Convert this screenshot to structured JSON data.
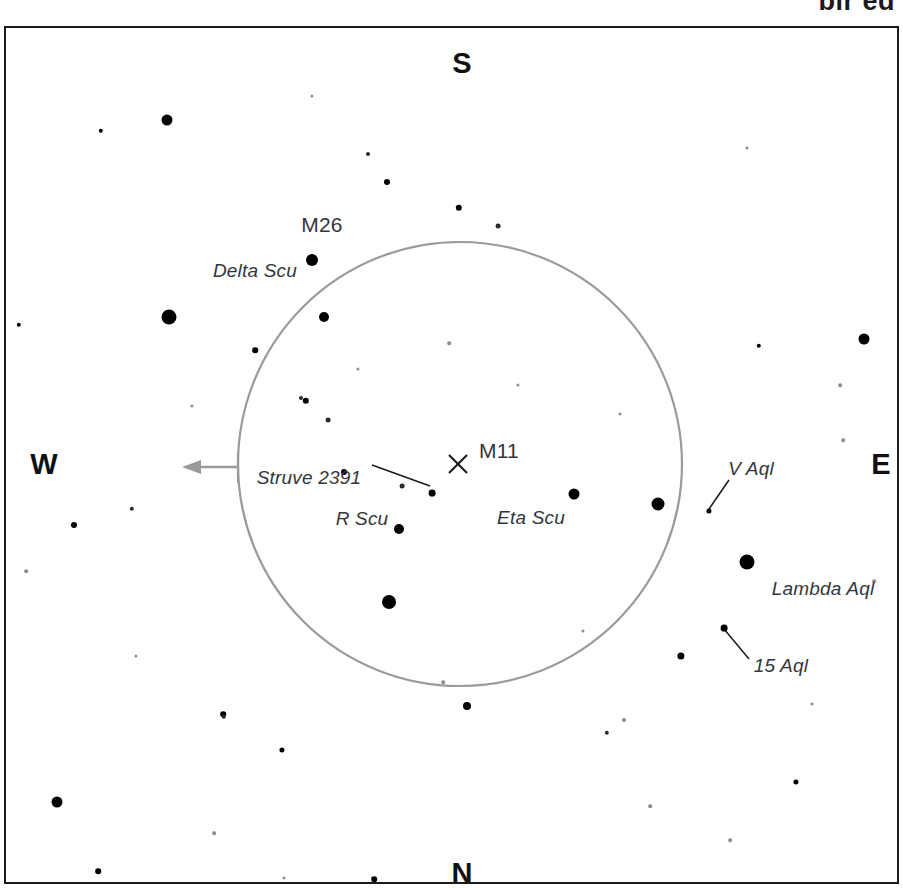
{
  "header": {
    "cropped_text": "bir ed"
  },
  "chart": {
    "frame": {
      "x": 4,
      "y": 26,
      "width": 895,
      "height": 858
    },
    "background_color": "#ffffff",
    "border_color": "#1b1b1b",
    "star_color": "#000000",
    "label_color": "#33363b",
    "fov_circle_color": "#9a9a9a",
    "arrow_color": "#9a9a9a"
  },
  "cardinals": [
    {
      "label": "S",
      "x": 456,
      "y": 35
    },
    {
      "label": "W",
      "x": 38,
      "y": 436
    },
    {
      "label": "E",
      "x": 875,
      "y": 436
    },
    {
      "label": "N",
      "x": 456,
      "y": 845
    }
  ],
  "fov_circle": {
    "cx": 454,
    "cy": 436,
    "r": 222,
    "stroke": "#9a9a9a",
    "stroke_width": 2.2
  },
  "west_arrow": {
    "from_x": 232,
    "from_y": 439,
    "to_x": 178,
    "to_y": 439,
    "tick_x": 232,
    "tick_top": 424,
    "tick_bottom": 455,
    "stroke": "#9a9a9a"
  },
  "center_marker": {
    "name": "M11",
    "x": 452,
    "y": 436,
    "size": 19,
    "stroke": "#1b1b1b"
  },
  "leader_lines": [
    {
      "name": "struve-2391-leader",
      "x1": 366,
      "y1": 437,
      "x2": 424,
      "y2": 458
    },
    {
      "name": "v-aql-leader",
      "x1": 723,
      "y1": 452,
      "x2": 703,
      "y2": 481
    },
    {
      "name": "15-aql-leader",
      "x1": 743,
      "y1": 631,
      "x2": 718,
      "y2": 601
    }
  ],
  "labels": [
    {
      "id": "m26",
      "text": "M26",
      "x": 316,
      "y": 197,
      "kind": "obj"
    },
    {
      "id": "delta-scu",
      "text": "Delta Scu",
      "x": 249,
      "y": 243,
      "kind": "star"
    },
    {
      "id": "struve-2391",
      "text": "Struve 2391",
      "x": 303,
      "y": 450,
      "kind": "star"
    },
    {
      "id": "m11",
      "text": "M11",
      "x": 493,
      "y": 423,
      "kind": "obj"
    },
    {
      "id": "r-scu",
      "text": "R Scu",
      "x": 356,
      "y": 491,
      "kind": "star"
    },
    {
      "id": "eta-scu",
      "text": "Eta Scu",
      "x": 525,
      "y": 490,
      "kind": "star"
    },
    {
      "id": "v-aql",
      "text": "V Aql",
      "x": 745,
      "y": 441,
      "kind": "star"
    },
    {
      "id": "lambda-aql",
      "text": "Lambda Aql",
      "x": 817,
      "y": 561,
      "kind": "star"
    },
    {
      "id": "15-aql",
      "text": "15 Aql",
      "x": 775,
      "y": 638,
      "kind": "star"
    }
  ],
  "stars": [
    {
      "id": "s1",
      "x": 161,
      "y": 92,
      "r": 5.5
    },
    {
      "id": "s2",
      "x": 95,
      "y": 103,
      "r": 2.2
    },
    {
      "id": "s3",
      "x": 306,
      "y": 68,
      "r": 1.6,
      "class": "vfaint"
    },
    {
      "id": "s4",
      "x": 362,
      "y": 126,
      "r": 2.0,
      "class": "faint"
    },
    {
      "id": "s5",
      "x": 381,
      "y": 154,
      "r": 3.0
    },
    {
      "id": "s6",
      "x": 453,
      "y": 180,
      "r": 3.2
    },
    {
      "id": "s7",
      "x": 492,
      "y": 198,
      "r": 2.4,
      "class": "faint"
    },
    {
      "id": "s8",
      "x": 741,
      "y": 120,
      "r": 1.6,
      "class": "vfaint"
    },
    {
      "id": "s9",
      "x": 306,
      "y": 232,
      "r": 6.0
    },
    {
      "id": "s10",
      "x": 163,
      "y": 289,
      "r": 7.5
    },
    {
      "id": "s11",
      "x": 318,
      "y": 289,
      "r": 5.0
    },
    {
      "id": "s12",
      "x": 13,
      "y": 297,
      "r": 2.2
    },
    {
      "id": "s13",
      "x": 858,
      "y": 311,
      "r": 5.5
    },
    {
      "id": "s14",
      "x": 753,
      "y": 318,
      "r": 2.2
    },
    {
      "id": "s15",
      "x": 249,
      "y": 322,
      "r": 2.8
    },
    {
      "id": "s16",
      "x": 443,
      "y": 315,
      "r": 1.8,
      "class": "vfaint"
    },
    {
      "id": "s17",
      "x": 834,
      "y": 357,
      "r": 1.8,
      "class": "vfaint"
    },
    {
      "id": "s18",
      "x": 295,
      "y": 370,
      "r": 2.0,
      "class": "faint"
    },
    {
      "id": "s19",
      "x": 300,
      "y": 373,
      "r": 3.2
    },
    {
      "id": "s20",
      "x": 322,
      "y": 392,
      "r": 2.4,
      "class": "faint"
    },
    {
      "id": "s21",
      "x": 338,
      "y": 444,
      "r": 3.0
    },
    {
      "id": "s22",
      "x": 837,
      "y": 412,
      "r": 1.8,
      "class": "vfaint"
    },
    {
      "id": "s23",
      "x": 426,
      "y": 465,
      "r": 3.4
    },
    {
      "id": "s24",
      "x": 396,
      "y": 458,
      "r": 2.4,
      "class": "faint"
    },
    {
      "id": "s25",
      "x": 393,
      "y": 501,
      "r": 5.0
    },
    {
      "id": "s26",
      "x": 568,
      "y": 466,
      "r": 5.5
    },
    {
      "id": "s27",
      "x": 652,
      "y": 476,
      "r": 6.5
    },
    {
      "id": "s28",
      "x": 703,
      "y": 483,
      "r": 2.6
    },
    {
      "id": "s29",
      "x": 126,
      "y": 481,
      "r": 2.2,
      "class": "faint"
    },
    {
      "id": "s30",
      "x": 68,
      "y": 497,
      "r": 3.0
    },
    {
      "id": "s31",
      "x": 20,
      "y": 543,
      "r": 1.8,
      "class": "vfaint"
    },
    {
      "id": "s32",
      "x": 741,
      "y": 534,
      "r": 7.5
    },
    {
      "id": "s33",
      "x": 383,
      "y": 574,
      "r": 7.0
    },
    {
      "id": "s34",
      "x": 718,
      "y": 600,
      "r": 3.4
    },
    {
      "id": "s35",
      "x": 675,
      "y": 628,
      "r": 3.6
    },
    {
      "id": "s36",
      "x": 461,
      "y": 678,
      "r": 4.0
    },
    {
      "id": "s37",
      "x": 437,
      "y": 654,
      "r": 1.8,
      "class": "vfaint"
    },
    {
      "id": "s38",
      "x": 217,
      "y": 686,
      "r": 2.8
    },
    {
      "id": "s39",
      "x": 276,
      "y": 722,
      "r": 2.6
    },
    {
      "id": "s40",
      "x": 218,
      "y": 689,
      "r": 2.2,
      "class": "faint"
    },
    {
      "id": "s41",
      "x": 618,
      "y": 692,
      "r": 2.0,
      "class": "vfaint"
    },
    {
      "id": "s42",
      "x": 790,
      "y": 754,
      "r": 2.6
    },
    {
      "id": "s43",
      "x": 51,
      "y": 774,
      "r": 5.5
    },
    {
      "id": "s44",
      "x": 601,
      "y": 705,
      "r": 2.2,
      "class": "faint"
    },
    {
      "id": "s45",
      "x": 208,
      "y": 805,
      "r": 1.8,
      "class": "vfaint"
    },
    {
      "id": "s46",
      "x": 92,
      "y": 843,
      "r": 2.8
    },
    {
      "id": "s47",
      "x": 368,
      "y": 851,
      "r": 2.8
    },
    {
      "id": "s48",
      "x": 724,
      "y": 812,
      "r": 1.8,
      "class": "vfaint"
    },
    {
      "id": "s49",
      "x": 644,
      "y": 778,
      "r": 1.8,
      "class": "vfaint"
    },
    {
      "id": "s50",
      "x": 278,
      "y": 850,
      "r": 1.6,
      "class": "vfaint"
    },
    {
      "id": "s51",
      "x": 868,
      "y": 553,
      "r": 1.8,
      "class": "vfaint"
    },
    {
      "id": "s52",
      "x": 512,
      "y": 357,
      "r": 1.6,
      "class": "vfaint"
    },
    {
      "id": "s53",
      "x": 614,
      "y": 386,
      "r": 1.6,
      "class": "vfaint"
    },
    {
      "id": "s54",
      "x": 352,
      "y": 341,
      "r": 1.6,
      "class": "vfaint"
    },
    {
      "id": "s55",
      "x": 186,
      "y": 378,
      "r": 1.6,
      "class": "vfaint"
    },
    {
      "id": "s56",
      "x": 577,
      "y": 603,
      "r": 1.6,
      "class": "vfaint"
    },
    {
      "id": "s57",
      "x": 806,
      "y": 676,
      "r": 1.6,
      "class": "vfaint"
    },
    {
      "id": "s58",
      "x": 130,
      "y": 628,
      "r": 1.6,
      "class": "vfaint"
    }
  ]
}
